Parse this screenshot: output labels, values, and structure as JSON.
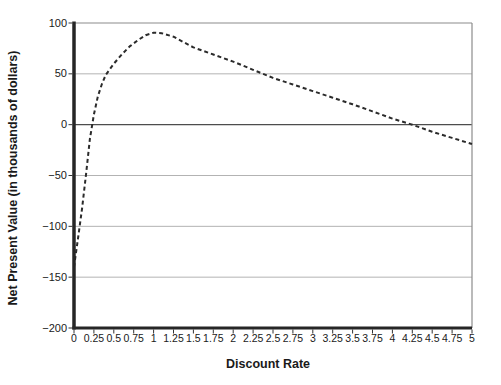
{
  "chart_data": {
    "type": "line",
    "title": "",
    "xlabel": "Discount Rate",
    "ylabel": "Net Present Value (in thousands of dollars)",
    "xlim": [
      0,
      5
    ],
    "ylim": [
      -200,
      100
    ],
    "grid": true,
    "legend_position": "none",
    "x_ticks": [
      {
        "label": "0",
        "value": 0
      },
      {
        "label": "0.25",
        "value": 0.25
      },
      {
        "label": "0.5",
        "value": 0.5
      },
      {
        "label": "0.75",
        "value": 0.75
      },
      {
        "label": "1",
        "value": 1
      },
      {
        "label": "1.25",
        "value": 1.25
      },
      {
        "label": "1.5",
        "value": 1.5
      },
      {
        "label": "1.75",
        "value": 1.75
      },
      {
        "label": "2",
        "value": 2
      },
      {
        "label": "2.25",
        "value": 2.25
      },
      {
        "label": "2.5",
        "value": 2.5
      },
      {
        "label": "2.75",
        "value": 2.75
      },
      {
        "label": "3",
        "value": 3
      },
      {
        "label": "3.25",
        "value": 3.25
      },
      {
        "label": "3.5",
        "value": 3.5
      },
      {
        "label": "3.75",
        "value": 3.75
      },
      {
        "label": "4",
        "value": 4
      },
      {
        "label": "4.25",
        "value": 4.25
      },
      {
        "label": "4.5",
        "value": 4.5
      },
      {
        "label": "4.75",
        "value": 4.75
      },
      {
        "label": "5",
        "value": 5
      }
    ],
    "y_ticks": [
      {
        "label": "100",
        "value": 100
      },
      {
        "label": "50",
        "value": 50
      },
      {
        "label": "0",
        "value": 0
      },
      {
        "label": "−50",
        "value": -50
      },
      {
        "label": "−100",
        "value": -100
      },
      {
        "label": "−150",
        "value": -150
      },
      {
        "label": "−200",
        "value": -200
      }
    ],
    "series": [
      {
        "name": "NPV curve",
        "line_style": "dashed",
        "color": "#2b2b2b",
        "x": [
          0,
          0.05,
          0.1,
          0.15,
          0.2,
          0.25,
          0.3,
          0.35,
          0.4,
          0.5,
          0.6,
          0.7,
          0.8,
          0.9,
          1.0,
          1.1,
          1.25,
          1.5,
          1.75,
          2.0,
          2.25,
          2.5,
          2.75,
          3.0,
          3.25,
          3.5,
          3.75,
          4.0,
          4.25,
          4.5,
          4.75,
          5.0
        ],
        "y": [
          -140,
          -112,
          -83,
          -50,
          -14,
          10,
          28,
          40,
          49,
          60,
          69,
          77,
          83,
          88,
          90.5,
          90,
          86.5,
          76,
          69,
          62,
          54,
          46,
          39.5,
          33,
          26.5,
          20,
          13,
          6,
          0,
          -7,
          -13,
          -19
        ]
      }
    ],
    "colors": {
      "grid": "#b3b3b3",
      "frame": "#8c8c8c",
      "zero_line": "#4d4d4d",
      "axis": "#262626",
      "tick": "#333333",
      "text": "#1a1a1a",
      "background": "#ffffff"
    }
  }
}
